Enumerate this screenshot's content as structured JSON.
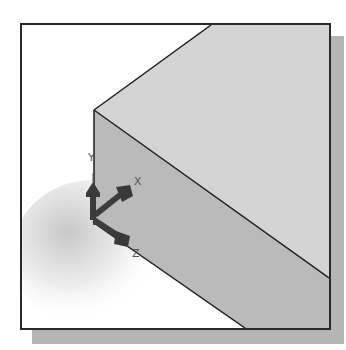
{
  "figure": {
    "colors": {
      "background": "#ffffff",
      "frame_border": "#2a2a2a",
      "drop_shadow": "#b5b5b5",
      "top_face": "#d4d4d4",
      "front_face": "#bababa",
      "edge": "#1e1e1e",
      "triad": "#3c3c3c"
    }
  },
  "triad": {
    "axes": [
      {
        "name": "Y",
        "label": "Y"
      },
      {
        "name": "X",
        "label": "X"
      },
      {
        "name": "Z",
        "label": "Z"
      }
    ]
  }
}
